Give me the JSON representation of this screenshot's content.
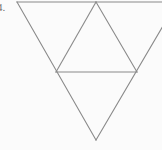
{
  "figure": {
    "label": "4.",
    "background_color": "#fbfbfb",
    "stroke_color": "#8a8a8a",
    "stroke_width": 1,
    "canvas": {
      "width": 162,
      "height": 150
    },
    "shapes": [
      {
        "name": "outer-inverted-triangle",
        "type": "polygon",
        "points": "17,2 177,2 96,140"
      },
      {
        "name": "inner-upright-triangle",
        "type": "polygon",
        "points": "96,2 56,72 137,72"
      }
    ],
    "segments": [
      {
        "name": "top-edge",
        "x1": 17,
        "y1": 2,
        "x2": 177,
        "y2": 2
      },
      {
        "name": "outer-left-edge",
        "x1": 17,
        "y1": 2,
        "x2": 96,
        "y2": 140
      },
      {
        "name": "outer-right-edge",
        "x1": 177,
        "y1": 2,
        "x2": 96,
        "y2": 140
      },
      {
        "name": "inner-left-edge",
        "x1": 96,
        "y1": 2,
        "x2": 56,
        "y2": 72
      },
      {
        "name": "inner-right-edge",
        "x1": 96,
        "y1": 2,
        "x2": 137,
        "y2": 72
      },
      {
        "name": "inner-base-midsegment",
        "x1": 56,
        "y1": 72,
        "x2": 137,
        "y2": 72
      }
    ]
  }
}
